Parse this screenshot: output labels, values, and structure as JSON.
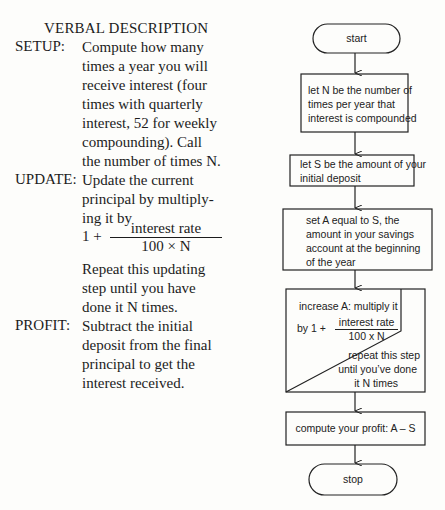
{
  "verbal": {
    "title": "VERBAL DESCRIPTION",
    "sections": [
      {
        "label": "SETUP:",
        "lines": [
          "Compute how many",
          "times a year you will",
          "receive interest (four",
          "times with quarterly",
          "interest, 52 for weekly",
          "compounding). Call",
          "the number of times N."
        ]
      },
      {
        "label": "UPDATE:",
        "lines": [
          "Update the current",
          "principal by multiply-",
          "ing it by"
        ],
        "formula": {
          "one_plus": "1 +",
          "numerator": "interest rate",
          "denominator": "100 ×  N"
        },
        "lines_after": [
          "Repeat this updating",
          "step until you have",
          "done it N times."
        ]
      },
      {
        "label": "PROFIT:",
        "lines": [
          "Subtract the initial",
          "deposit from the final",
          "principal to get the",
          "interest received."
        ]
      }
    ]
  },
  "flowchart": {
    "start": "start",
    "step1": [
      "let N be the number of",
      "times per year that",
      "interest is compounded"
    ],
    "step2": [
      "let S be the amount of your",
      "initial deposit"
    ],
    "step3": [
      "set A equal to S, the",
      "amount in your savings",
      "account at the beginning",
      "of the year"
    ],
    "loop": {
      "line1": "increase A: multiply it",
      "by_prefix": "by 1 +",
      "numerator": "interest rate",
      "denominator": "100 x N",
      "repeat": [
        "repeat this step",
        "until you’ve done",
        "it N times"
      ]
    },
    "step5": "compute your profit:  A – S",
    "stop": "stop"
  }
}
